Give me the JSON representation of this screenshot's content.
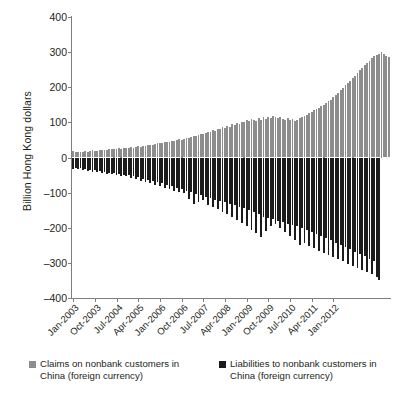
{
  "chart_data": {
    "type": "bar",
    "title": "",
    "subtitle": "",
    "xlabel": "",
    "ylabel": "Billion Hong Kong dollars",
    "ylim": [
      -400,
      400
    ],
    "yticks": [
      400,
      300,
      200,
      100,
      0,
      -100,
      -200,
      -300,
      -400
    ],
    "grid": false,
    "legend_position": "bottom",
    "orientation": "vertical",
    "stacked_about_zero": true,
    "x_tick_labels": [
      "Jan-2003",
      "Oct-2003",
      "Jul-2004",
      "Apr-2005",
      "Jan-2006",
      "Oct-2006",
      "Jul-2007",
      "Apr-2008",
      "Jan-2009",
      "Oct-2009",
      "Jul-2010",
      "Apr-2011",
      "Jan-2012"
    ],
    "x_tick_interval_months": 9,
    "x_start": "Jan-2003",
    "x_end": "Mar-2012",
    "series": [
      {
        "name": "Claims on nonbank customers in China (foreign currency)",
        "color": "#8d8d8d",
        "values": [
          18,
          16,
          15,
          17,
          16,
          18,
          17,
          19,
          20,
          18,
          19,
          21,
          22,
          20,
          22,
          24,
          23,
          25,
          24,
          26,
          25,
          27,
          26,
          28,
          30,
          28,
          31,
          33,
          31,
          34,
          33,
          35,
          37,
          36,
          38,
          40,
          42,
          40,
          43,
          45,
          44,
          47,
          46,
          49,
          52,
          50,
          54,
          56,
          55,
          58,
          62,
          60,
          65,
          68,
          66,
          70,
          74,
          72,
          78,
          76,
          82,
          80,
          86,
          84,
          90,
          88,
          94,
          92,
          98,
          96,
          102,
          100,
          106,
          104,
          110,
          108,
          105,
          112,
          108,
          114,
          110,
          116,
          112,
          118,
          114,
          112,
          116,
          110,
          108,
          112,
          106,
          110,
          104,
          108,
          112,
          116,
          118,
          122,
          126,
          130,
          134,
          138,
          142,
          146,
          150,
          155,
          160,
          165,
          172,
          178,
          185,
          192,
          198,
          205,
          212,
          218,
          225,
          232,
          240,
          248,
          255,
          262,
          268,
          275,
          282,
          288,
          292,
          296,
          300,
          295,
          290,
          286
        ]
      },
      {
        "name": "Liabilities to nonbank customers in China (foreign currency)",
        "color": "#1b1b1b",
        "values": [
          -32,
          -30,
          -34,
          -31,
          -36,
          -33,
          -38,
          -35,
          -40,
          -37,
          -42,
          -39,
          -44,
          -41,
          -46,
          -43,
          -48,
          -45,
          -50,
          -47,
          -52,
          -49,
          -54,
          -51,
          -58,
          -53,
          -62,
          -56,
          -66,
          -60,
          -70,
          -63,
          -74,
          -67,
          -78,
          -70,
          -82,
          -74,
          -86,
          -78,
          -90,
          -82,
          -94,
          -86,
          -98,
          -90,
          -102,
          -94,
          -118,
          -98,
          -132,
          -104,
          -128,
          -108,
          -122,
          -112,
          -136,
          -116,
          -142,
          -120,
          -148,
          -124,
          -155,
          -128,
          -162,
          -132,
          -170,
          -136,
          -178,
          -140,
          -186,
          -144,
          -196,
          -150,
          -206,
          -156,
          -216,
          -162,
          -226,
          -168,
          -210,
          -172,
          -196,
          -176,
          -188,
          -180,
          -200,
          -184,
          -212,
          -188,
          -224,
          -192,
          -236,
          -196,
          -248,
          -200,
          -244,
          -206,
          -252,
          -212,
          -258,
          -218,
          -266,
          -224,
          -272,
          -230,
          -278,
          -236,
          -284,
          -242,
          -290,
          -248,
          -296,
          -254,
          -302,
          -260,
          -308,
          -268,
          -314,
          -274,
          -320,
          -280,
          -326,
          -288,
          -332,
          -296,
          -340,
          -348
        ]
      }
    ]
  },
  "legend": {
    "items": [
      {
        "label_line1": "Claims on nonbank customers in",
        "label_line2": "China (foreign currency)",
        "swatch": "claims"
      },
      {
        "label_line1": "Liabilities to nonbank customers in",
        "label_line2": "China (foreign currency)",
        "swatch": "liab"
      }
    ]
  }
}
